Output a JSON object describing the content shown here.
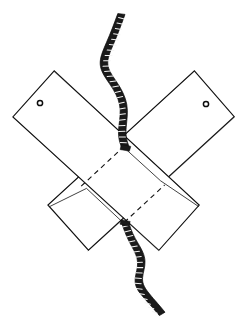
{
  "figure": {
    "background_color": "#ffffff",
    "ink_color": "#111111",
    "cord_color": "#1a1a1a",
    "width": 247,
    "height": 331,
    "style": "hand-drawn pen line illustration",
    "visible_text": ""
  },
  "parts": {
    "board_left": {
      "name": "board-left",
      "description": "flat strip running from upper-left down to lower-right",
      "corners": "54,71 13,117 159,250 199,205",
      "hole": {
        "cx": 40,
        "cy": 103,
        "r": 2.6
      }
    },
    "board_right": {
      "name": "board-right",
      "description": "flat strip running from upper-right down to lower-left",
      "corners": "194,71 234,117 88,250 48,205",
      "hole": {
        "cx": 206,
        "cy": 104,
        "r": 2.6
      }
    },
    "overlap": {
      "name": "overlap-region",
      "description": "diamond where the two boards cross",
      "corners": "123,147 165,185 124,223 81,186"
    },
    "hidden_edges": [
      {
        "name": "hidden-edge-upper-left",
        "from": "81,186",
        "to": "122,148"
      },
      {
        "name": "hidden-edge-lower-right",
        "from": "124,222",
        "to": "164,185"
      }
    ],
    "cord": {
      "name": "twisted-cord",
      "description": "dark twisted cord entering at top and exiting at bottom through the crossing point",
      "top_end": "120,14",
      "bottom_end": "162,316",
      "pass_through": "126,148",
      "twist_count_upper": 22,
      "twist_count_lower": 18
    }
  },
  "annotations": {
    "labels": [],
    "dimensions": []
  }
}
